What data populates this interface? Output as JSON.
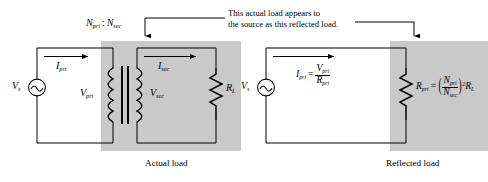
{
  "figure": {
    "annotation_line1": "This actual load appears to",
    "annotation_line2": "the source as this reflected load.",
    "left_caption": "Actual load",
    "right_caption": "Reflected load",
    "shade_color": "#c9c9c9",
    "line_color": "#000000",
    "background": "#ffffff"
  },
  "left_circuit": {
    "source_label": "V",
    "source_sub": "s",
    "source_symbol": "ac-sine",
    "current_pri": "I",
    "current_pri_sub": "pri",
    "current_sec": "I",
    "current_sec_sub": "sec",
    "v_pri": "V",
    "v_pri_sub": "pri",
    "v_sec": "V",
    "v_sec_sub": "sec",
    "turns_label_pri": "N",
    "turns_label_pri_sub": "pri",
    "turns_separator": ":",
    "turns_label_sec": "N",
    "turns_label_sec_sub": "sec",
    "load_label": "R",
    "load_label_sub": "L",
    "transformer_turns": 5
  },
  "right_circuit": {
    "source_label": "V",
    "source_sub": "s",
    "source_symbol": "ac-sine",
    "current_label": "I",
    "current_label_sub": "pri",
    "equals": "=",
    "numerator": "V",
    "numerator_sub": "pri",
    "denominator": "R",
    "denominator_sub": "pri",
    "resistor_label": "R",
    "resistor_label_sub": "pri",
    "resistor_equals": "=",
    "ratio_numerator": "N",
    "ratio_numerator_sub": "pri",
    "ratio_denominator": "N",
    "ratio_denominator_sub": "sec",
    "exponent": "2",
    "times_label": "R",
    "times_label_sub": "L",
    "paren_open": "(",
    "paren_close": ")"
  }
}
